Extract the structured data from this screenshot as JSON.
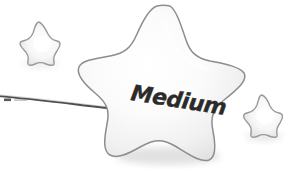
{
  "illustration": {
    "title": "Medium star illustration",
    "background_color": "#ffffff"
  },
  "main_star": {
    "label": "Medium",
    "label_color": "#2b2b2b",
    "label_rotation_deg": 9,
    "fill_start": "#ffffff",
    "fill_end": "#e3e3e3",
    "outline_color": "#8d8d8d",
    "shadow_color": "#dcdcdc"
  },
  "small_star_top_left": {
    "name": "small-star-upper-left",
    "fill_start": "#ffffff",
    "fill_end": "#dedede",
    "outline_color": "#9a9a9a"
  },
  "small_star_bottom_right": {
    "name": "small-star-lower-right",
    "fill_start": "#ffffff",
    "fill_end": "#dedede",
    "outline_color": "#9a9a9a"
  },
  "wand_line": {
    "name": "wand-stick",
    "color": "#4f4f4f",
    "thickness_px": 1.8
  }
}
